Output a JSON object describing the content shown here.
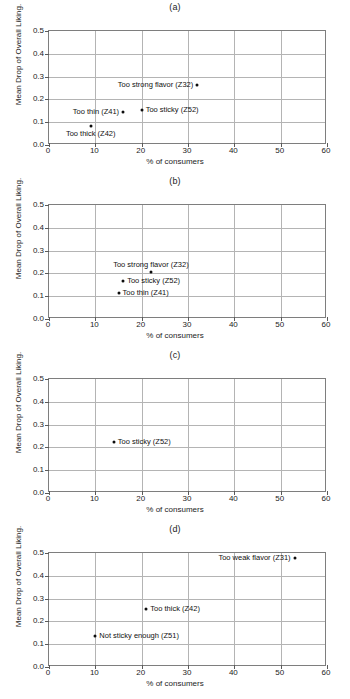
{
  "figure": {
    "width": 350,
    "height": 699,
    "panel_count": 4
  },
  "axis": {
    "xlabel": "% of consumers",
    "ylabel": "Mean Drop of Overall Liking.",
    "xticks": [
      "0",
      "10",
      "20",
      "30",
      "40",
      "50",
      "60"
    ],
    "yticks": [
      "0.0",
      "0.1",
      "0.2",
      "0.3",
      "0.4",
      "0.5"
    ],
    "xlim": [
      0,
      60
    ],
    "ylim": [
      0,
      0.5
    ]
  },
  "chart_data": [
    {
      "type": "scatter",
      "title": "(a)",
      "xlabel": "% of consumers",
      "ylabel": "Mean Drop of Overall Liking.",
      "xlim": [
        0,
        60
      ],
      "ylim": [
        0,
        0.5
      ],
      "xticks": [
        0,
        10,
        20,
        30,
        40,
        50,
        60
      ],
      "yticks": [
        0.0,
        0.1,
        0.2,
        0.3,
        0.4,
        0.5
      ],
      "grid": true,
      "legend": "none",
      "points": [
        {
          "label": "Too strong flavor (Z32)",
          "x": 32.0,
          "y": 0.265,
          "anchor": "left"
        },
        {
          "label": "Too thin (Z41)",
          "x": 16.0,
          "y": 0.145,
          "anchor": "left"
        },
        {
          "label": "Too sticky (Z52)",
          "x": 20.0,
          "y": 0.152,
          "anchor": "right"
        },
        {
          "label": "Too thick (Z42)",
          "x": 9.0,
          "y": 0.085,
          "anchor": "below-left"
        }
      ]
    },
    {
      "type": "scatter",
      "title": "(b)",
      "xlabel": "% of consumers",
      "ylabel": "Mean Drop of Overall Liking.",
      "xlim": [
        0,
        60
      ],
      "ylim": [
        0,
        0.5
      ],
      "xticks": [
        0,
        10,
        20,
        30,
        40,
        50,
        60
      ],
      "yticks": [
        0.0,
        0.1,
        0.2,
        0.3,
        0.4,
        0.5
      ],
      "grid": true,
      "legend": "none",
      "points": [
        {
          "label": "Too strong flavor (Z32)",
          "x": 22.0,
          "y": 0.205,
          "anchor": "above"
        },
        {
          "label": "Too sticky (Z52)",
          "x": 16.0,
          "y": 0.168,
          "anchor": "right"
        },
        {
          "label": "Too thin (Z41)",
          "x": 15.0,
          "y": 0.115,
          "anchor": "right"
        }
      ]
    },
    {
      "type": "scatter",
      "title": "(c)",
      "xlabel": "% of consumers",
      "ylabel": "Mean Drop of Overall Liking.",
      "xlim": [
        0,
        60
      ],
      "ylim": [
        0,
        0.5
      ],
      "xticks": [
        0,
        10,
        20,
        30,
        40,
        50,
        60
      ],
      "yticks": [
        0.0,
        0.1,
        0.2,
        0.3,
        0.4,
        0.5
      ],
      "grid": true,
      "legend": "none",
      "points": [
        {
          "label": "Too sticky (Z52)",
          "x": 14.0,
          "y": 0.225,
          "anchor": "right"
        }
      ]
    },
    {
      "type": "scatter",
      "title": "(d)",
      "xlabel": "% of consumers",
      "ylabel": "Mean Drop of Overall Liking.",
      "xlim": [
        0,
        60
      ],
      "ylim": [
        0,
        0.5
      ],
      "xticks": [
        0,
        10,
        20,
        30,
        40,
        50,
        60
      ],
      "yticks": [
        0.0,
        0.1,
        0.2,
        0.3,
        0.4,
        0.5
      ],
      "grid": true,
      "legend": "none",
      "points": [
        {
          "label": "Too weak flavor (Z31)",
          "x": 53.0,
          "y": 0.48,
          "anchor": "left"
        },
        {
          "label": "Too thick (Z42)",
          "x": 21.0,
          "y": 0.255,
          "anchor": "right"
        },
        {
          "label": "Not sticky enough (Z51)",
          "x": 10.0,
          "y": 0.138,
          "anchor": "right"
        }
      ]
    }
  ],
  "colors": {
    "marker": "#0d0d0d",
    "grid": "#b4b4b4",
    "frame": "#7e7e7e",
    "text": "#1d1d1d",
    "background": "#ffffff"
  }
}
